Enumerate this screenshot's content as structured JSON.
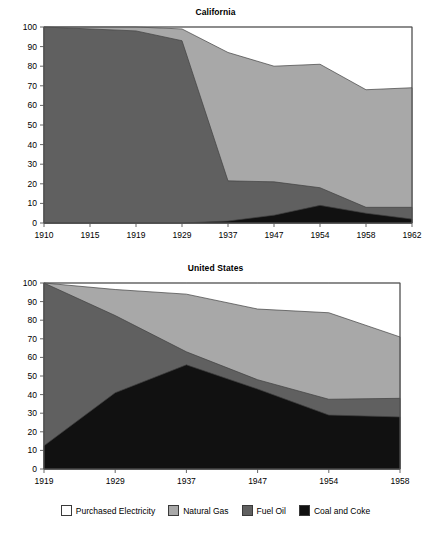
{
  "figure": {
    "background": "#ffffff"
  },
  "series_colors": {
    "purchased_electricity": "#ffffff",
    "natural_gas": "#a8a8a8",
    "fuel_oil": "#606060",
    "coal_and_coke": "#111111",
    "axis": "#555555",
    "outline": "#404040"
  },
  "legend": {
    "items": [
      {
        "label": "Purchased Electricity",
        "color": "#ffffff",
        "key": "purchased_electricity"
      },
      {
        "label": "Natural Gas",
        "color": "#a8a8a8",
        "key": "natural_gas"
      },
      {
        "label": "Fuel Oil",
        "color": "#606060",
        "key": "fuel_oil"
      },
      {
        "label": "Coal and Coke",
        "color": "#111111",
        "key": "coal_and_coke"
      }
    ]
  },
  "chart_data": [
    {
      "type": "area",
      "id": "california",
      "title": "California",
      "xlabel": "",
      "ylabel": "",
      "stacked": true,
      "stack_order_bottom_to_top": [
        "Coal and Coke",
        "Fuel Oil",
        "Natural Gas",
        "Purchased Electricity"
      ],
      "x": [
        1910,
        1915,
        1919,
        1929,
        1937,
        1947,
        1954,
        1958,
        1962
      ],
      "categories": [
        "1910",
        "1915",
        "1919",
        "1929",
        "1937",
        "1947",
        "1954",
        "1958",
        "1962"
      ],
      "xtick_labels": [
        "1910",
        "1915",
        "1919",
        "1929",
        "1937",
        "1947",
        "1954",
        "1958",
        "1962"
      ],
      "ytick_labels": [
        "0",
        "10",
        "20",
        "30",
        "40",
        "50",
        "60",
        "70",
        "80",
        "90",
        "100"
      ],
      "yticks": [
        0,
        10,
        20,
        30,
        40,
        50,
        60,
        70,
        80,
        90,
        100
      ],
      "ylim": [
        0,
        100
      ],
      "xlim": [
        1910,
        1962
      ],
      "grid": false,
      "legend_position": "below-figure",
      "series": [
        {
          "name": "Coal and Coke",
          "color": "#111111",
          "values": [
            0,
            0,
            0,
            0,
            1,
            4,
            9,
            5,
            2
          ]
        },
        {
          "name": "Fuel Oil",
          "color": "#606060",
          "values": [
            100,
            99,
            98,
            93,
            20.5,
            17,
            9,
            3,
            6
          ]
        },
        {
          "name": "Natural Gas",
          "color": "#a8a8a8",
          "values": [
            0,
            1,
            2,
            6,
            65.5,
            59,
            63,
            60,
            61
          ]
        },
        {
          "name": "Purchased Electricity",
          "color": "#ffffff",
          "values": [
            0,
            0,
            0,
            1,
            13,
            20,
            19,
            32,
            31
          ]
        }
      ],
      "cumulative_tops": {
        "Coal and Coke": [
          0,
          0,
          0,
          0,
          1,
          4,
          9,
          5,
          2
        ],
        "Fuel Oil": [
          100,
          99,
          98,
          93,
          21.5,
          21,
          18,
          8,
          8
        ],
        "Natural Gas": [
          100,
          100,
          100,
          99,
          87,
          80,
          81,
          68,
          69
        ],
        "Purchased Electricity": [
          100,
          100,
          100,
          100,
          100,
          100,
          100,
          100,
          100
        ]
      }
    },
    {
      "type": "area",
      "id": "united-states",
      "title": "United States",
      "xlabel": "",
      "ylabel": "",
      "stacked": true,
      "stack_order_bottom_to_top": [
        "Coal and Coke",
        "Fuel Oil",
        "Natural Gas",
        "Purchased Electricity"
      ],
      "x": [
        1919,
        1929,
        1937,
        1947,
        1954,
        1958
      ],
      "categories": [
        "1919",
        "1929",
        "1937",
        "1947",
        "1954",
        "1958"
      ],
      "xtick_labels": [
        "1919",
        "1929",
        "1937",
        "1947",
        "1954",
        "1958"
      ],
      "ytick_labels": [
        "0",
        "10",
        "20",
        "30",
        "40",
        "50",
        "60",
        "70",
        "80",
        "90",
        "100"
      ],
      "yticks": [
        0,
        10,
        20,
        30,
        40,
        50,
        60,
        70,
        80,
        90,
        100
      ],
      "ylim": [
        0,
        100
      ],
      "xlim": [
        1919,
        1958
      ],
      "grid": false,
      "legend_position": "below-figure",
      "series": [
        {
          "name": "Coal and Coke",
          "color": "#111111",
          "values": [
            12.5,
            41,
            56,
            43,
            29,
            28
          ]
        },
        {
          "name": "Fuel Oil",
          "color": "#606060",
          "values": [
            87.5,
            41.5,
            7,
            5,
            8.5,
            10
          ]
        },
        {
          "name": "Natural Gas",
          "color": "#a8a8a8",
          "values": [
            0,
            14,
            31,
            38,
            46.5,
            33
          ]
        },
        {
          "name": "Purchased Electricity",
          "color": "#ffffff",
          "values": [
            0,
            3.5,
            6,
            14,
            16,
            29
          ]
        }
      ],
      "cumulative_tops": {
        "Coal and Coke": [
          12.5,
          41,
          56,
          43,
          29,
          28
        ],
        "Fuel Oil": [
          100,
          82.5,
          63,
          48,
          37.5,
          38
        ],
        "Natural Gas": [
          100,
          96.5,
          94,
          86,
          84,
          71
        ],
        "Purchased Electricity": [
          100,
          100,
          100,
          100,
          100,
          100
        ]
      }
    }
  ]
}
